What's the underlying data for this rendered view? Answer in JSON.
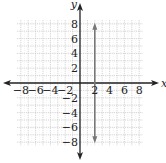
{
  "chart_data": {
    "type": "line",
    "title": "",
    "xlabel": "x",
    "ylabel": "y",
    "xlim": [
      -8.5,
      8.5
    ],
    "ylim": [
      -8.5,
      8.5
    ],
    "grid": true,
    "grid_step": 1,
    "x_tick_labels": [
      "-8",
      "-6",
      "-4",
      "-2",
      "2",
      "4",
      "6",
      "8"
    ],
    "y_tick_labels": [
      "8",
      "6",
      "4",
      "2",
      "-2",
      "-4",
      "-6",
      "-8"
    ],
    "x_ticks": [
      -8,
      -6,
      -4,
      -2,
      2,
      4,
      6,
      8
    ],
    "y_ticks": [
      8,
      6,
      4,
      2,
      -2,
      -4,
      -6,
      -8
    ],
    "series": [
      {
        "name": "x = 2",
        "equation": "x = 2",
        "x": [
          2,
          2
        ],
        "y": [
          -8,
          8
        ],
        "arrows_both_ends": true,
        "color": "#777777"
      }
    ],
    "legend": null
  },
  "colors": {
    "axis": "#222222",
    "grid": "#c8c8c8",
    "line": "#777777"
  }
}
